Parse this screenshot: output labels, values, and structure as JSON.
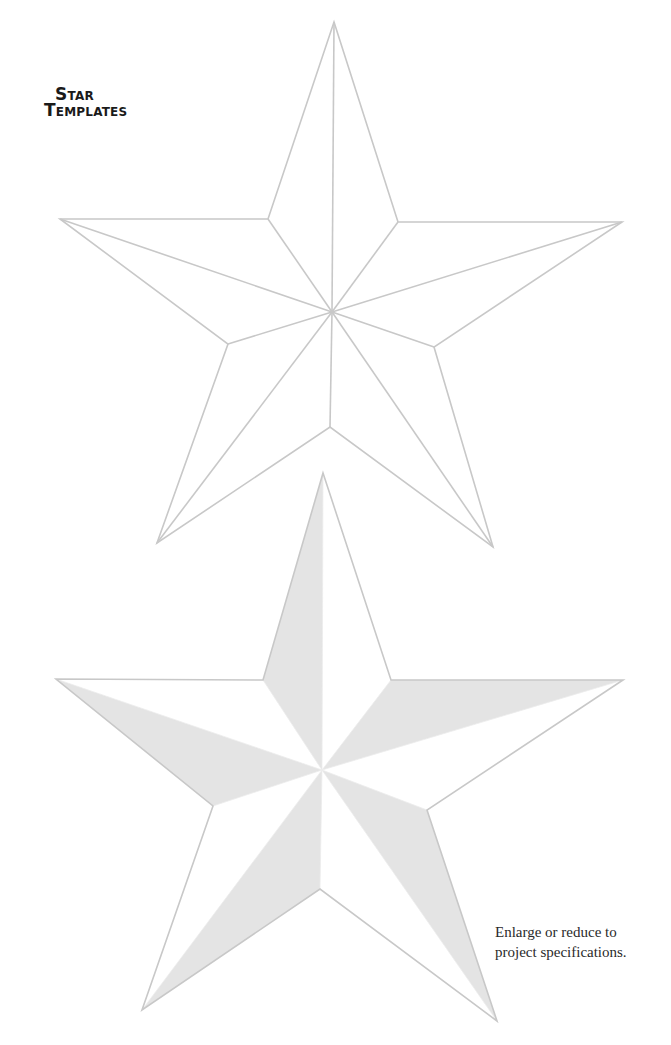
{
  "document": {
    "title_line1": "Star",
    "title_line2": "Templates",
    "caption_line1": "Enlarge or reduce to",
    "caption_line2": "project specifications."
  },
  "colors": {
    "outline": "#c8c8c8",
    "shade": "#e4e4e4",
    "background": "#ffffff"
  },
  "templates": [
    {
      "name": "outline-star",
      "style": "line-drawing",
      "center": [
        332,
        312
      ],
      "outer_points": [
        [
          334,
          22
        ],
        [
          622,
          222
        ],
        [
          493,
          547
        ],
        [
          157,
          543
        ],
        [
          60,
          219
        ]
      ],
      "inner_points": [
        [
          398,
          222
        ],
        [
          434,
          347
        ],
        [
          330,
          427
        ],
        [
          228,
          344
        ],
        [
          268,
          219
        ]
      ]
    },
    {
      "name": "shaded-star",
      "style": "half-shaded-facets",
      "center": [
        322,
        770
      ],
      "outer_points": [
        [
          323,
          473
        ],
        [
          623,
          680
        ],
        [
          497,
          1021
        ],
        [
          142,
          1010
        ],
        [
          56,
          679
        ]
      ],
      "inner_points": [
        [
          391,
          680
        ],
        [
          427,
          810
        ],
        [
          320,
          889
        ],
        [
          213,
          806
        ],
        [
          263,
          680
        ]
      ]
    }
  ]
}
